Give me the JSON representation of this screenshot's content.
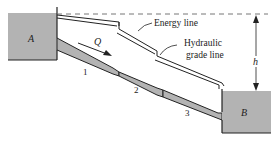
{
  "figure": {
    "type": "pipe-system-diagram",
    "reservoirs": [
      {
        "id": "A",
        "label": "A"
      },
      {
        "id": "B",
        "label": "B"
      }
    ],
    "flow_label": "Q",
    "pipe_segments": [
      {
        "id": "1",
        "label": "1"
      },
      {
        "id": "2",
        "label": "2"
      },
      {
        "id": "3",
        "label": "3"
      }
    ],
    "annotations": {
      "energy_line": "Energy line",
      "hgl_line1": "Hydraulic",
      "hgl_line2": "grade line",
      "head_difference": "h"
    },
    "colors": {
      "water": "#b3b3b3",
      "outline": "#222222",
      "dashed": "#666666",
      "background": "#ffffff"
    }
  }
}
